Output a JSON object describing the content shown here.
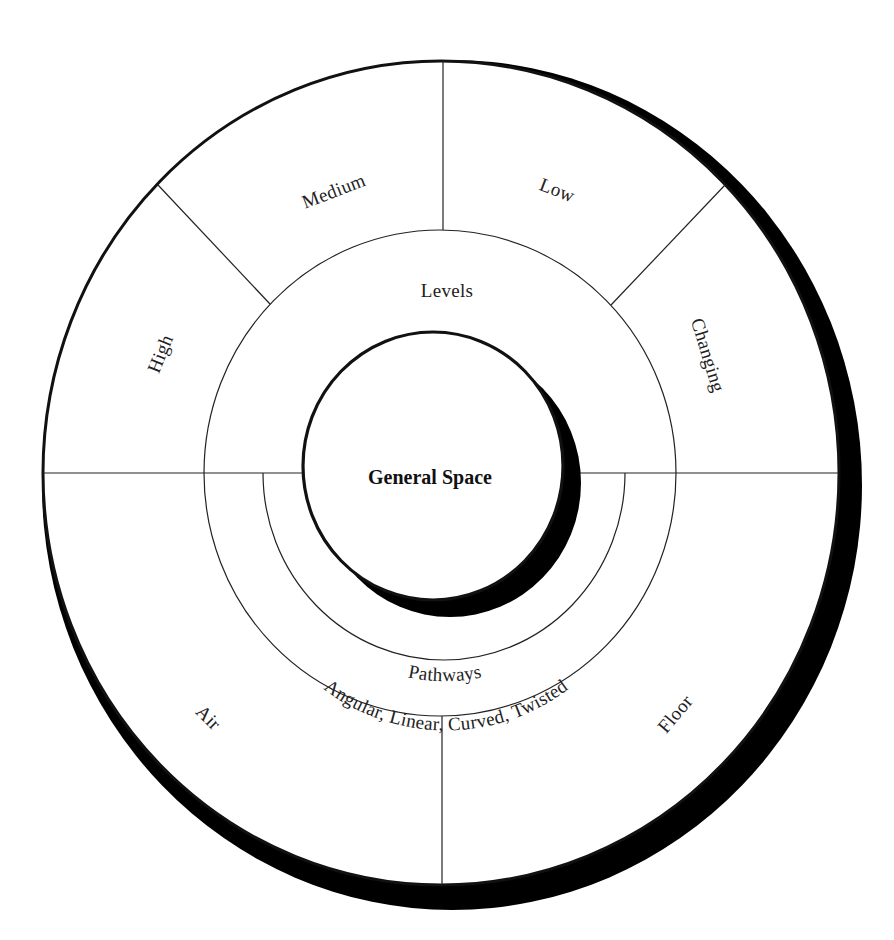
{
  "diagram": {
    "center": {
      "label": "General Space"
    },
    "middle_ring": {
      "label": "Levels"
    },
    "pathways_ring": {
      "label": "Pathways",
      "sublabel": "Angular, Linear, Curved, Twisted"
    },
    "outer_segments": {
      "high": "High",
      "medium": "Medium",
      "low": "Low",
      "changing": "Changing",
      "air": "Air",
      "floor": "Floor"
    },
    "colors": {
      "line": "#222222",
      "shadow": "#000000",
      "background": "#ffffff"
    }
  }
}
